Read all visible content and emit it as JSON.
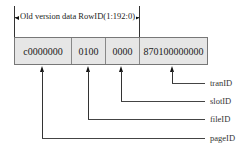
{
  "header": {
    "label": "Old version data RowID(1:192:0)"
  },
  "segments": [
    {
      "value": "c0000000",
      "field": "pageID"
    },
    {
      "value": "0100",
      "field": "fileID"
    },
    {
      "value": "0000",
      "field": "slotID"
    },
    {
      "value": "870100000000",
      "field": "tranID"
    }
  ],
  "labels": {
    "tranID": "tranID",
    "slotID": "slotID",
    "fileID": "fileID",
    "pageID": "pageID"
  },
  "colors": {
    "box_fill": "#e6e6e6",
    "line": "#333333"
  }
}
